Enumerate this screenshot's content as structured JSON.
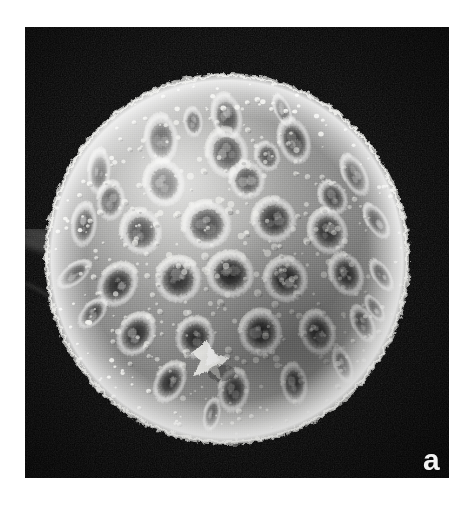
{
  "figure": {
    "kind": "scanning-electron-micrograph",
    "panel_label": "a",
    "background_color": "#ffffff",
    "plate_color": "#080808",
    "plate": {
      "x": 25,
      "y": 27,
      "width": 424,
      "height": 451
    }
  },
  "specimen": {
    "shape": "sphere",
    "center_x": 227,
    "center_y": 259,
    "radius_x": 181,
    "radius_y": 184,
    "surface_texture": "scabrate-granular with circular pits",
    "highlight_color": "#f2f2f0",
    "midtone_color": "#8d8d8c",
    "shadow_color": "#3c3c3c",
    "rim_color": "#fbfbf9",
    "pit_count": 38,
    "granule_count": 420,
    "pits": [
      {
        "cx": 0.5,
        "cy": 0.085,
        "r": 0.048,
        "depth": 0.3,
        "tilt": 0
      },
      {
        "cx": 0.665,
        "cy": 0.065,
        "r": 0.034,
        "depth": 0.24,
        "tilt": -14
      },
      {
        "cx": 0.305,
        "cy": 0.15,
        "r": 0.05,
        "depth": 0.32,
        "tilt": 12
      },
      {
        "cx": 0.5,
        "cy": 0.19,
        "r": 0.05,
        "depth": 0.38,
        "tilt": 0
      },
      {
        "cx": 0.7,
        "cy": 0.155,
        "r": 0.047,
        "depth": 0.33,
        "tilt": -10
      },
      {
        "cx": 0.12,
        "cy": 0.245,
        "r": 0.046,
        "depth": 0.3,
        "tilt": 22
      },
      {
        "cx": 0.313,
        "cy": 0.278,
        "r": 0.047,
        "depth": 0.4,
        "tilt": 6
      },
      {
        "cx": 0.88,
        "cy": 0.255,
        "r": 0.045,
        "depth": 0.3,
        "tilt": -22
      },
      {
        "cx": 0.075,
        "cy": 0.4,
        "r": 0.045,
        "depth": 0.32,
        "tilt": 28
      },
      {
        "cx": 0.245,
        "cy": 0.42,
        "r": 0.046,
        "depth": 0.42,
        "tilt": 8
      },
      {
        "cx": 0.44,
        "cy": 0.4,
        "r": 0.048,
        "depth": 0.46,
        "tilt": 0
      },
      {
        "cx": 0.64,
        "cy": 0.385,
        "r": 0.045,
        "depth": 0.42,
        "tilt": -8
      },
      {
        "cx": 0.8,
        "cy": 0.42,
        "r": 0.046,
        "depth": 0.4,
        "tilt": -18
      },
      {
        "cx": 0.945,
        "cy": 0.39,
        "r": 0.04,
        "depth": 0.3,
        "tilt": -30
      },
      {
        "cx": 0.045,
        "cy": 0.545,
        "r": 0.04,
        "depth": 0.28,
        "tilt": 32
      },
      {
        "cx": 0.175,
        "cy": 0.575,
        "r": 0.047,
        "depth": 0.42,
        "tilt": 16
      },
      {
        "cx": 0.355,
        "cy": 0.56,
        "r": 0.046,
        "depth": 0.48,
        "tilt": 4
      },
      {
        "cx": 0.51,
        "cy": 0.545,
        "r": 0.046,
        "depth": 0.58,
        "tilt": 0
      },
      {
        "cx": 0.675,
        "cy": 0.56,
        "r": 0.045,
        "depth": 0.52,
        "tilt": -6
      },
      {
        "cx": 0.855,
        "cy": 0.545,
        "r": 0.044,
        "depth": 0.42,
        "tilt": -22
      },
      {
        "cx": 0.96,
        "cy": 0.548,
        "r": 0.036,
        "depth": 0.32,
        "tilt": -32
      },
      {
        "cx": 0.23,
        "cy": 0.72,
        "r": 0.046,
        "depth": 0.44,
        "tilt": 18
      },
      {
        "cx": 0.405,
        "cy": 0.73,
        "r": 0.042,
        "depth": 0.46,
        "tilt": 6
      },
      {
        "cx": 0.6,
        "cy": 0.715,
        "r": 0.046,
        "depth": 0.56,
        "tilt": -6
      },
      {
        "cx": 0.77,
        "cy": 0.715,
        "r": 0.045,
        "depth": 0.44,
        "tilt": -18
      },
      {
        "cx": 0.905,
        "cy": 0.69,
        "r": 0.04,
        "depth": 0.34,
        "tilt": -28
      },
      {
        "cx": 0.33,
        "cy": 0.86,
        "r": 0.044,
        "depth": 0.4,
        "tilt": 16
      },
      {
        "cx": 0.52,
        "cy": 0.885,
        "r": 0.044,
        "depth": 0.4,
        "tilt": 2
      },
      {
        "cx": 0.7,
        "cy": 0.865,
        "r": 0.042,
        "depth": 0.38,
        "tilt": -14
      },
      {
        "cx": 0.845,
        "cy": 0.81,
        "r": 0.038,
        "depth": 0.3,
        "tilt": -24
      },
      {
        "cx": 0.155,
        "cy": 0.33,
        "r": 0.04,
        "depth": 0.28,
        "tilt": 24
      },
      {
        "cx": 0.56,
        "cy": 0.27,
        "r": 0.038,
        "depth": 0.3,
        "tilt": -4
      },
      {
        "cx": 0.4,
        "cy": 0.1,
        "r": 0.03,
        "depth": 0.2,
        "tilt": 8
      },
      {
        "cx": 0.815,
        "cy": 0.32,
        "r": 0.036,
        "depth": 0.26,
        "tilt": -24
      },
      {
        "cx": 0.1,
        "cy": 0.66,
        "r": 0.036,
        "depth": 0.28,
        "tilt": 26
      },
      {
        "cx": 0.455,
        "cy": 0.955,
        "r": 0.034,
        "depth": 0.26,
        "tilt": 2
      },
      {
        "cx": 0.62,
        "cy": 0.2,
        "r": 0.03,
        "depth": 0.22,
        "tilt": -10
      },
      {
        "cx": 0.94,
        "cy": 0.645,
        "r": 0.03,
        "depth": 0.24,
        "tilt": -34
      }
    ]
  },
  "artifacts": {
    "debris_particle": {
      "name": "bright debris fragment",
      "cx": 0.455,
      "cy": 0.795,
      "size": 0.085,
      "color": "#f6f6f2"
    },
    "filament": {
      "name": "faint filament at left edge",
      "x1": 0.0,
      "y1": 0.455,
      "x2": 0.165,
      "y2": 0.512,
      "color": "#9a9a98"
    }
  }
}
